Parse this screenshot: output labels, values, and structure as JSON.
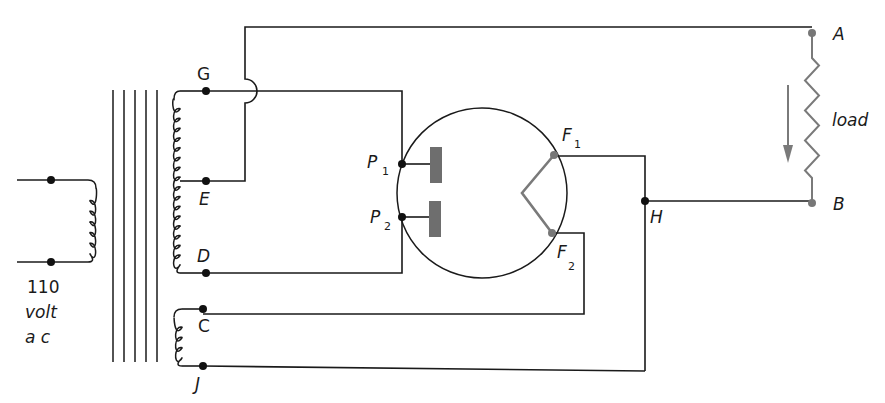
{
  "diagram": {
    "supply_label": {
      "line1": "110",
      "line2": "volt",
      "line3": "a c"
    },
    "terminals": {
      "G": "G",
      "E": "E",
      "D": "D",
      "C": "C",
      "J": "J",
      "H": "H",
      "A": "A",
      "B": "B"
    },
    "tube": {
      "plate1": {
        "letter": "P",
        "sub": "1"
      },
      "plate2": {
        "letter": "P",
        "sub": "2"
      },
      "filament1": {
        "letter": "F",
        "sub": "1"
      },
      "filament2": {
        "letter": "F",
        "sub": "2"
      }
    },
    "load_label": "load",
    "colors": {
      "wire": "#1a1a1a",
      "plates": "#6e6e6e",
      "filament": "#7a7a7a",
      "current_arrow": "#7a7a7a"
    }
  }
}
